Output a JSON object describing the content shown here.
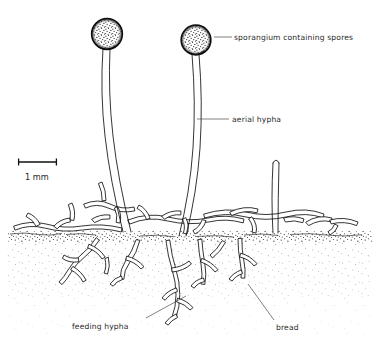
{
  "diagram": {
    "background_color": "#ffffff",
    "ink_color": "#111111",
    "leader_color": "#4a4a4a",
    "text_color": "#2a2a2a"
  },
  "labels": [
    {
      "id": "sporangium",
      "text": "sporangium containing spores",
      "x": 234,
      "y": 40,
      "anchor": "start",
      "leader": "M 214 37 L 232 37"
    },
    {
      "id": "aerial-hypha",
      "text": "aerial hypha",
      "x": 232,
      "y": 122,
      "anchor": "start",
      "leader": "M 197 119 L 229 119"
    },
    {
      "id": "feeding-hypha",
      "text": "feeding hypha",
      "x": 72,
      "y": 329,
      "anchor": "start",
      "leader": "M 146 318 L 186 296"
    },
    {
      "id": "bread",
      "text": "bread",
      "x": 276,
      "y": 330,
      "anchor": "start",
      "leader": "M 274 320 L 248 284"
    }
  ],
  "scale_bar": {
    "label": "1 mm",
    "label_x": 25,
    "label_y": 180,
    "bar_y": 162,
    "bar_x1": 18,
    "bar_x2": 57,
    "tick_height": 7
  },
  "structures": {
    "sporangia": [
      {
        "id": "sporangium-left",
        "cx": 107,
        "cy": 34,
        "r": 15.5,
        "stipple_seed": 11
      },
      {
        "id": "sporangium-right",
        "cx": 196,
        "cy": 40,
        "r": 15.0,
        "stipple_seed": 29
      }
    ],
    "aerial_stalks": [
      {
        "id": "aerial-stalk-left",
        "top_x": 107,
        "top_y": 49,
        "base_x": 127,
        "base_y": 232
      },
      {
        "id": "aerial-stalk-right",
        "top_x": 196,
        "top_y": 55,
        "base_x": 181,
        "base_y": 236
      },
      {
        "id": "aerial-stalk-short",
        "top_x": 276,
        "top_y": 158,
        "base_x": 274,
        "base_y": 232
      }
    ],
    "surface": {
      "id": "bread-surface",
      "y": 232,
      "x1": 8,
      "x2": 372,
      "stipple_band_height": 10,
      "substrate_depth": 110
    },
    "counts": {
      "sporangia": 2,
      "aerial_hyphae": 3,
      "surface_hyphae_branches": 14,
      "feeding_hyphae_branches": 12
    }
  }
}
